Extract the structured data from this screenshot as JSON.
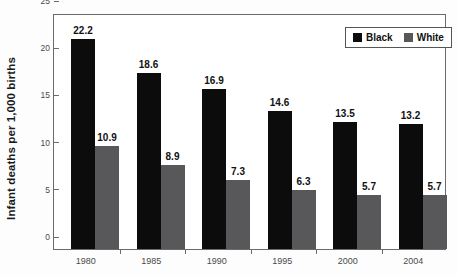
{
  "chart_data": {
    "type": "bar",
    "title": "",
    "subtitle": "",
    "xlabel": "",
    "ylabel": "Infant deaths per 1,000 births",
    "categories": [
      "1980",
      "1985",
      "1990",
      "1995",
      "2000",
      "2004"
    ],
    "series": [
      {
        "name": "Black",
        "color": "#0c0c0c",
        "values": [
          22.2,
          18.6,
          16.9,
          14.6,
          13.5,
          13.2
        ]
      },
      {
        "name": "White",
        "color": "#58585a",
        "values": [
          10.9,
          8.9,
          7.3,
          6.3,
          5.7,
          5.7
        ]
      }
    ],
    "value_labels": {
      "Black": [
        "22.2",
        "18.6",
        "16.9",
        "14.6",
        "13.5",
        "13.2"
      ],
      "White": [
        "10.9",
        "8.9",
        "7.3",
        "6.3",
        "5.7",
        "5.7"
      ]
    },
    "ylim": [
      0,
      25
    ],
    "yticks": [
      0,
      5,
      10,
      15,
      20,
      25
    ],
    "ytick_labels": [
      "0",
      "5",
      "10",
      "15",
      "20",
      "25"
    ],
    "grid": false,
    "legend_position": "top-right",
    "legend_entries": [
      "Black",
      "White"
    ]
  },
  "legend": {
    "items": [
      {
        "label": "Black",
        "swatch": "black-swatch-icon"
      },
      {
        "label": "White",
        "swatch": "gray-swatch-icon"
      }
    ]
  }
}
